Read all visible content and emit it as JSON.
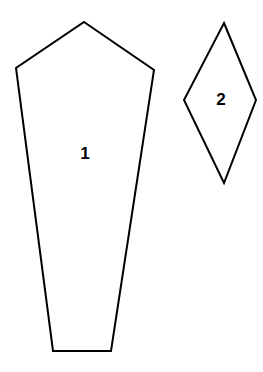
{
  "document": {
    "title": "Pattern Pieces Diagram",
    "background_color": "#ffffff",
    "width": 263,
    "height": 372
  },
  "style": {
    "stroke_color": "#000000",
    "fill_color": "#ffffff",
    "stroke_width": 2,
    "label_color": "#000000"
  },
  "shapes": [
    {
      "id": "shape-1",
      "label": "1",
      "type": "pentagon",
      "description": "tall tapering five-sided pattern piece with pointed top and flat bottom",
      "points": "84,22 154,70 111,351 53,351 16,68",
      "label_x": 85,
      "label_y": 155
    },
    {
      "id": "shape-2",
      "label": "2",
      "type": "rhombus",
      "description": "narrow four-sided diamond pattern piece",
      "points": "224,23 256,100 224,183 184,100",
      "label_x": 221,
      "label_y": 101
    }
  ]
}
